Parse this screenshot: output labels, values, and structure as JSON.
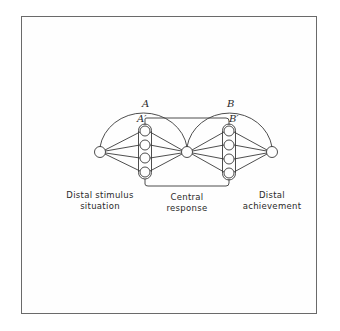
{
  "figure": {
    "type": "lens-model-diagram",
    "labels": {
      "arc_a": "A",
      "arc_a_prime": "A′",
      "arc_b": "B",
      "arc_b_prime": "B′",
      "left_line1": "Distal stimulus",
      "left_line2": "situation",
      "center_line1": "Central",
      "center_line2": "response",
      "right_line1": "Distal",
      "right_line2": "achievement"
    },
    "nodes": [
      {
        "id": "distal-stimulus",
        "x": 100,
        "y": 152
      },
      {
        "id": "central-response",
        "x": 187,
        "y": 152
      },
      {
        "id": "distal-achievement",
        "x": 272,
        "y": 152
      }
    ],
    "columns": [
      {
        "id": "A-prime",
        "x": 145,
        "cue_ys": [
          131,
          145,
          158,
          172
        ]
      },
      {
        "id": "B-prime",
        "x": 229,
        "cue_ys": [
          131,
          145,
          159,
          173
        ]
      }
    ],
    "colors": {
      "line": "#3a3a3a",
      "frame": "#6a6a6a",
      "background": "#ffffff"
    }
  }
}
